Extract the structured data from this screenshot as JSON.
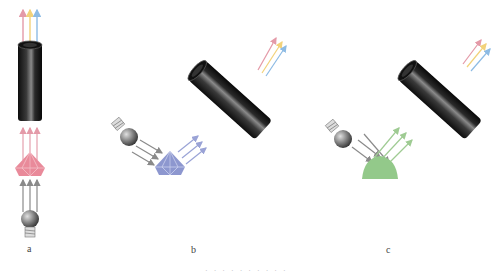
{
  "diagram": {
    "panels": [
      {
        "id": "a",
        "label": "a",
        "geometry": "transmission",
        "sample": "faceted-gem",
        "sample_color": "#e98a9a",
        "incident_ray_color": "#8a8a8a",
        "transmitted_ray_color": "#e5a0ad"
      },
      {
        "id": "b",
        "label": "b",
        "geometry": "reflection",
        "sample": "faceted-gem",
        "sample_color": "#8d97cf",
        "incident_ray_color": "#8a8a8a",
        "reflected_ray_color": "#9aa3d6"
      },
      {
        "id": "c",
        "label": "c",
        "geometry": "diffuse-reflection",
        "sample": "cabochon",
        "sample_color": "#93c98a",
        "incident_ray_color": "#8a8a8a",
        "reflected_ray_color": "#9fcb93"
      }
    ],
    "output_rays": [
      "#e49aa8",
      "#f2d27a",
      "#8dbbe4"
    ],
    "detector_color": "#1c1c1c",
    "lamp_color": "#7a7a7a",
    "caption": "· · · · · · · · · ·"
  }
}
